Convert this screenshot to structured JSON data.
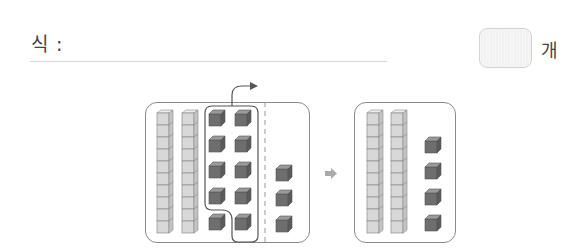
{
  "header": {
    "formula_label": "식 :",
    "answer_value": "",
    "unit_label": "개"
  },
  "diagram": {
    "before": {
      "tens_rods": 2,
      "ones_cubes_grouped": 10,
      "ones_cubes_remaining": 3,
      "group_arrow": "curved-arrow-right"
    },
    "transition_arrow": "right-arrow",
    "after": {
      "tens_rods": 2,
      "ones_cubes": 4
    }
  },
  "colors": {
    "rod_fill": "#d6d6d6",
    "rod_stroke": "#8c8c8c",
    "cube_fill": "#6e6e6e",
    "cube_top": "#8e8e8e",
    "panel_border": "#8a8a8a"
  }
}
